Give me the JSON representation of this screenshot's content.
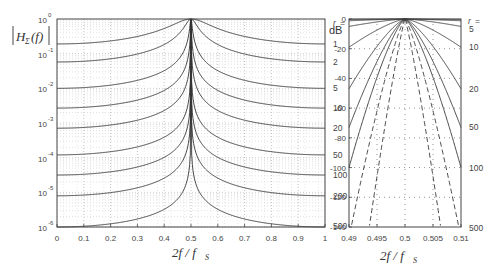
{
  "chart_data": [
    {
      "type": "line",
      "title": "",
      "ylabel": "|H_Σ(f)|",
      "xlabel": "2f / f_S",
      "yscale": "log",
      "ylim": [
        1e-06,
        1
      ],
      "xlim": [
        0,
        1
      ],
      "grid": true,
      "x_ticks": [
        "0",
        "0.1",
        "0.2",
        "0.3",
        "0.4",
        "0.5",
        "0.6",
        "0.7",
        "0.8",
        "0.9",
        "1"
      ],
      "y_ticks": [
        {
          "base": "10",
          "exp": "0"
        },
        {
          "base": "10",
          "exp": "-1"
        },
        {
          "base": "10",
          "exp": "-2"
        },
        {
          "base": "10",
          "exp": "-3"
        },
        {
          "base": "10",
          "exp": "-4"
        },
        {
          "base": "10",
          "exp": "-5"
        },
        {
          "base": "10",
          "exp": "-6"
        }
      ],
      "legend_title": "r =",
      "series": [
        {
          "name": "1",
          "edge_log10": -0.72,
          "peak": 1
        },
        {
          "name": "2",
          "edge_log10": -1.24,
          "peak": 1
        },
        {
          "name": "5",
          "edge_log10": -2.0,
          "peak": 1
        },
        {
          "name": "10",
          "edge_log10": -2.57,
          "peak": 1
        },
        {
          "name": "20",
          "edge_log10": -3.15,
          "peak": 1
        },
        {
          "name": "50",
          "edge_log10": -3.92,
          "peak": 1
        },
        {
          "name": "100",
          "edge_log10": -4.5,
          "peak": 1
        },
        {
          "name": "200",
          "edge_log10": -5.1,
          "peak": 1
        },
        {
          "name": "500",
          "edge_log10": -6.0,
          "peak": 1
        }
      ]
    },
    {
      "type": "line",
      "title": "",
      "ylabel": "dB",
      "xlabel": "2f / f_S",
      "ylim": [
        -140,
        0
      ],
      "xlim": [
        0.49,
        0.51
      ],
      "grid": true,
      "x_ticks": [
        "0.49",
        "0.495",
        "0.5",
        "0.505",
        "0.51"
      ],
      "y_ticks": [
        "0",
        "-20",
        "-40",
        "-60",
        "-80",
        "-100",
        "-120",
        "-140"
      ],
      "legend_title": "r =",
      "series": [
        {
          "name": "1",
          "edge_db": -0.3,
          "style": "solid",
          "label": false
        },
        {
          "name": "2",
          "edge_db": -1.2,
          "style": "solid",
          "label": false
        },
        {
          "name": "5",
          "edge_db": -5,
          "style": "solid",
          "label": true
        },
        {
          "name": "10",
          "edge_db": -19,
          "style": "solid",
          "label": true
        },
        {
          "name": "20",
          "edge_db": -47,
          "style": "solid",
          "label": true
        },
        {
          "name": "50",
          "edge_db": -73,
          "style": "solid",
          "label": true
        },
        {
          "name": "100",
          "edge_db": -100,
          "style": "solid",
          "label": true
        },
        {
          "name": "200",
          "edge_db": -235,
          "style": "dashed",
          "label": false
        },
        {
          "name": "500",
          "edge_db": -138,
          "style": "dashed",
          "label": true,
          "narrow": true
        }
      ]
    }
  ],
  "labels": {
    "left_ylabel_main": "H",
    "left_ylabel_sub": "Σ",
    "left_ylabel_arg": "(f)",
    "xlabel_main": "2f / f",
    "xlabel_sub": "S",
    "db_label": "dB",
    "r_title": "r ="
  },
  "colors": {
    "curve": "#333333",
    "grid": "#9a9a9a",
    "axis": "#444444"
  }
}
